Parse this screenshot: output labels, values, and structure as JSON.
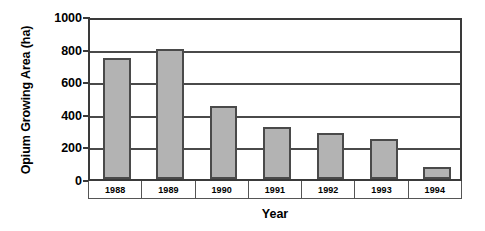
{
  "chart_data": {
    "type": "bar",
    "title": "",
    "xlabel": "Year",
    "ylabel": "Opium Growing Area (ha)",
    "categories": [
      "1988",
      "1989",
      "1990",
      "1991",
      "1992",
      "1993",
      "1994"
    ],
    "values": [
      740,
      800,
      450,
      320,
      280,
      245,
      75
    ],
    "series": [
      {
        "name": "Opium Growing Area (ha)",
        "values": [
          740,
          800,
          450,
          320,
          280,
          245,
          75
        ]
      }
    ],
    "ylim": [
      0,
      1000
    ],
    "yticks": [
      0,
      200,
      400,
      600,
      800,
      1000
    ],
    "ytick_labels": [
      "0",
      "200",
      "400",
      "600",
      "800",
      "1000"
    ],
    "grid": "horizontal",
    "legend": "none",
    "bar_color": "#b3b3b3",
    "bar_border_color": "#4a4a4a",
    "axis_color": "#3a3a3a",
    "background_color": "#ffffff"
  }
}
